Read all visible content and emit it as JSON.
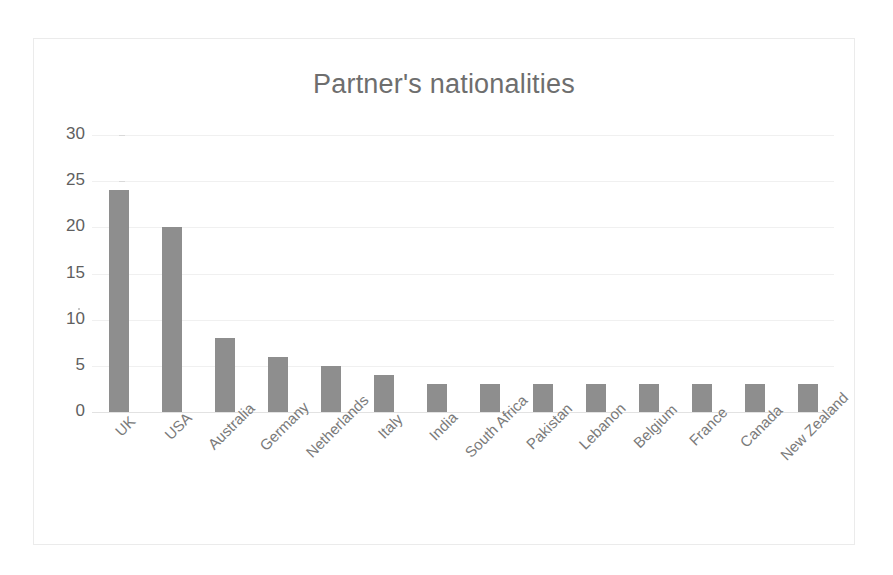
{
  "chart_data": {
    "type": "bar",
    "title": "Partner's nationalities",
    "xlabel": "",
    "ylabel": "",
    "ylim": [
      0,
      30
    ],
    "yticks": [
      0,
      5,
      10,
      15,
      20,
      25,
      30
    ],
    "grid": true,
    "legend": "none",
    "bar_color": "#8e8e8e",
    "background_color": "#ffffff",
    "border_color": "#ebebeb",
    "categories": [
      "UK",
      "USA",
      "Australia",
      "Germany",
      "Netherlands",
      "Italy",
      "India",
      "South Africa",
      "Pakistan",
      "Lebanon",
      "Belgium",
      "France",
      "Canada",
      "New Zealand"
    ],
    "values": [
      24,
      20,
      8,
      6,
      5,
      4,
      3,
      3,
      3,
      3,
      3,
      3,
      3,
      3
    ],
    "tick_labels": [
      "30",
      "25",
      "20",
      "15",
      "10",
      "5",
      "0"
    ]
  }
}
